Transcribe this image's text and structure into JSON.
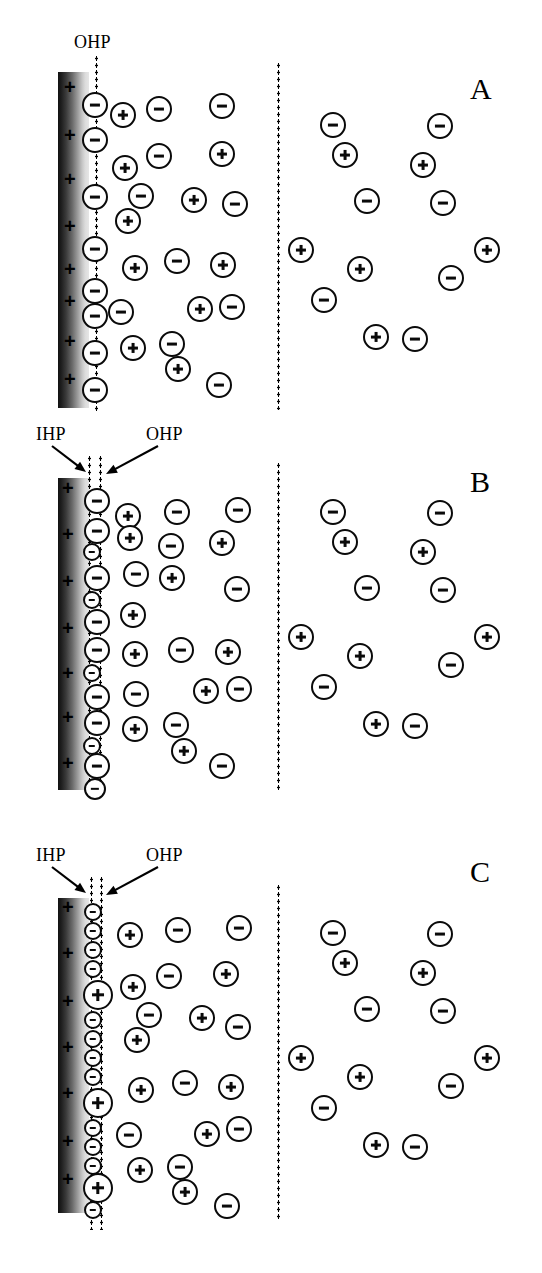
{
  "figure": {
    "width": 542,
    "height": 1273,
    "colors": {
      "ink": "#0a0a0a",
      "background": "#ffffff",
      "electrode_dark": "#111111",
      "electrode_light": "#e6e6e6"
    }
  },
  "panels": [
    {
      "id": "A",
      "label": "A",
      "label_x": 470,
      "label_y": 72,
      "top": 60,
      "electrode": {
        "x": 58,
        "y": 72,
        "w": 31,
        "h": 336
      },
      "planes": [
        {
          "name": "OHP",
          "x": 95,
          "y": 55,
          "h": 358
        }
      ],
      "bulk_boundary": {
        "x": 277,
        "y": 62,
        "h": 348
      },
      "annotations": [
        {
          "text": "OHP",
          "x": 74,
          "y": 32,
          "arrow": false
        }
      ],
      "surface_charges": [
        {
          "x": 64,
          "y": 86
        },
        {
          "x": 64,
          "y": 134
        },
        {
          "x": 64,
          "y": 178
        },
        {
          "x": 64,
          "y": 225
        },
        {
          "x": 64,
          "y": 268
        },
        {
          "x": 64,
          "y": 300
        },
        {
          "x": 64,
          "y": 340
        },
        {
          "x": 64,
          "y": 378
        }
      ],
      "compact_ions": [
        {
          "sign": "neg",
          "x": 95,
          "y": 105,
          "r": 13
        },
        {
          "sign": "neg",
          "x": 95,
          "y": 140,
          "r": 13
        },
        {
          "sign": "neg",
          "x": 95,
          "y": 197,
          "r": 13
        },
        {
          "sign": "neg",
          "x": 95,
          "y": 249,
          "r": 13
        },
        {
          "sign": "neg",
          "x": 95,
          "y": 291,
          "r": 13
        },
        {
          "sign": "neg",
          "x": 95,
          "y": 316,
          "r": 13
        },
        {
          "sign": "neg",
          "x": 95,
          "y": 353,
          "r": 13
        },
        {
          "sign": "neg",
          "x": 95,
          "y": 390,
          "r": 13
        }
      ],
      "diffuse_ions": [
        {
          "sign": "pos",
          "x": 123,
          "y": 115,
          "r": 13
        },
        {
          "sign": "neg",
          "x": 159,
          "y": 109,
          "r": 13
        },
        {
          "sign": "neg",
          "x": 222,
          "y": 106,
          "r": 13
        },
        {
          "sign": "neg",
          "x": 159,
          "y": 156,
          "r": 13
        },
        {
          "sign": "pos",
          "x": 222,
          "y": 154,
          "r": 13
        },
        {
          "sign": "pos",
          "x": 125,
          "y": 168,
          "r": 13
        },
        {
          "sign": "neg",
          "x": 141,
          "y": 196,
          "r": 13
        },
        {
          "sign": "pos",
          "x": 194,
          "y": 200,
          "r": 13
        },
        {
          "sign": "neg",
          "x": 235,
          "y": 204,
          "r": 13
        },
        {
          "sign": "pos",
          "x": 128,
          "y": 221,
          "r": 13
        },
        {
          "sign": "pos",
          "x": 135,
          "y": 268,
          "r": 13
        },
        {
          "sign": "neg",
          "x": 177,
          "y": 261,
          "r": 13
        },
        {
          "sign": "pos",
          "x": 223,
          "y": 265,
          "r": 13
        },
        {
          "sign": "neg",
          "x": 121,
          "y": 312,
          "r": 13
        },
        {
          "sign": "pos",
          "x": 200,
          "y": 309,
          "r": 13
        },
        {
          "sign": "neg",
          "x": 232,
          "y": 307,
          "r": 13
        },
        {
          "sign": "pos",
          "x": 133,
          "y": 348,
          "r": 13
        },
        {
          "sign": "neg",
          "x": 172,
          "y": 344,
          "r": 13
        },
        {
          "sign": "pos",
          "x": 178,
          "y": 369,
          "r": 13
        },
        {
          "sign": "neg",
          "x": 219,
          "y": 385,
          "r": 13
        }
      ],
      "bulk_ions": [
        {
          "sign": "neg",
          "x": 333,
          "y": 125,
          "r": 13
        },
        {
          "sign": "neg",
          "x": 440,
          "y": 126,
          "r": 13
        },
        {
          "sign": "pos",
          "x": 345,
          "y": 155,
          "r": 13
        },
        {
          "sign": "pos",
          "x": 423,
          "y": 165,
          "r": 13
        },
        {
          "sign": "neg",
          "x": 367,
          "y": 201,
          "r": 13
        },
        {
          "sign": "neg",
          "x": 443,
          "y": 203,
          "r": 13
        },
        {
          "sign": "pos",
          "x": 301,
          "y": 250,
          "r": 13
        },
        {
          "sign": "pos",
          "x": 487,
          "y": 250,
          "r": 13
        },
        {
          "sign": "pos",
          "x": 360,
          "y": 269,
          "r": 13
        },
        {
          "sign": "neg",
          "x": 451,
          "y": 278,
          "r": 13
        },
        {
          "sign": "neg",
          "x": 324,
          "y": 300,
          "r": 13
        },
        {
          "sign": "pos",
          "x": 376,
          "y": 337,
          "r": 13
        },
        {
          "sign": "neg",
          "x": 415,
          "y": 339,
          "r": 13
        }
      ]
    },
    {
      "id": "B",
      "label": "B",
      "label_x": 470,
      "label_y": 465,
      "top": 430,
      "electrode": {
        "x": 58,
        "y": 478,
        "w": 31,
        "h": 312
      },
      "planes": [
        {
          "name": "IHP",
          "x": 88,
          "y": 455,
          "h": 335
        },
        {
          "name": "OHP",
          "x": 99,
          "y": 455,
          "h": 340
        }
      ],
      "bulk_boundary": {
        "x": 277,
        "y": 462,
        "h": 330
      },
      "annotations": [
        {
          "text": "IHP",
          "x": 36,
          "y": 424,
          "arrow": true,
          "ax1": 52,
          "ay1": 446,
          "ax2": 86,
          "ay2": 472
        },
        {
          "text": "OHP",
          "x": 146,
          "y": 424,
          "arrow": true,
          "ax1": 158,
          "ay1": 446,
          "ax2": 106,
          "ay2": 474
        }
      ],
      "surface_charges": [
        {
          "x": 62,
          "y": 487
        },
        {
          "x": 62,
          "y": 533
        },
        {
          "x": 62,
          "y": 580
        },
        {
          "x": 62,
          "y": 627
        },
        {
          "x": 62,
          "y": 672
        },
        {
          "x": 62,
          "y": 716
        },
        {
          "x": 62,
          "y": 762
        }
      ],
      "compact_ions": [
        {
          "sign": "neg",
          "x": 97,
          "y": 501,
          "r": 13
        },
        {
          "sign": "neg",
          "x": 97,
          "y": 531,
          "r": 13
        },
        {
          "sign": "neg",
          "x": 92,
          "y": 552,
          "r": 9
        },
        {
          "sign": "neg",
          "x": 97,
          "y": 578,
          "r": 13
        },
        {
          "sign": "neg",
          "x": 92,
          "y": 600,
          "r": 9
        },
        {
          "sign": "neg",
          "x": 97,
          "y": 622,
          "r": 13
        },
        {
          "sign": "neg",
          "x": 97,
          "y": 650,
          "r": 13
        },
        {
          "sign": "neg",
          "x": 92,
          "y": 673,
          "r": 9
        },
        {
          "sign": "neg",
          "x": 97,
          "y": 697,
          "r": 13
        },
        {
          "sign": "neg",
          "x": 97,
          "y": 723,
          "r": 13
        },
        {
          "sign": "neg",
          "x": 92,
          "y": 746,
          "r": 9
        },
        {
          "sign": "neg",
          "x": 97,
          "y": 766,
          "r": 13
        },
        {
          "sign": "neg",
          "x": 95,
          "y": 789,
          "r": 11
        }
      ],
      "diffuse_ions": [
        {
          "sign": "pos",
          "x": 128,
          "y": 516,
          "r": 13
        },
        {
          "sign": "neg",
          "x": 177,
          "y": 512,
          "r": 13
        },
        {
          "sign": "neg",
          "x": 238,
          "y": 510,
          "r": 13
        },
        {
          "sign": "pos",
          "x": 130,
          "y": 538,
          "r": 13
        },
        {
          "sign": "neg",
          "x": 171,
          "y": 546,
          "r": 13
        },
        {
          "sign": "pos",
          "x": 222,
          "y": 543,
          "r": 13
        },
        {
          "sign": "neg",
          "x": 136,
          "y": 574,
          "r": 13
        },
        {
          "sign": "pos",
          "x": 172,
          "y": 578,
          "r": 13
        },
        {
          "sign": "neg",
          "x": 237,
          "y": 589,
          "r": 13
        },
        {
          "sign": "pos",
          "x": 133,
          "y": 615,
          "r": 13
        },
        {
          "sign": "pos",
          "x": 135,
          "y": 654,
          "r": 13
        },
        {
          "sign": "neg",
          "x": 181,
          "y": 650,
          "r": 13
        },
        {
          "sign": "pos",
          "x": 228,
          "y": 652,
          "r": 13
        },
        {
          "sign": "neg",
          "x": 136,
          "y": 694,
          "r": 13
        },
        {
          "sign": "pos",
          "x": 206,
          "y": 691,
          "r": 13
        },
        {
          "sign": "neg",
          "x": 239,
          "y": 689,
          "r": 13
        },
        {
          "sign": "pos",
          "x": 135,
          "y": 729,
          "r": 13
        },
        {
          "sign": "neg",
          "x": 176,
          "y": 725,
          "r": 13
        },
        {
          "sign": "pos",
          "x": 184,
          "y": 751,
          "r": 13
        },
        {
          "sign": "neg",
          "x": 222,
          "y": 766,
          "r": 13
        }
      ],
      "bulk_ions": [
        {
          "sign": "neg",
          "x": 333,
          "y": 512,
          "r": 13
        },
        {
          "sign": "neg",
          "x": 440,
          "y": 513,
          "r": 13
        },
        {
          "sign": "pos",
          "x": 345,
          "y": 542,
          "r": 13
        },
        {
          "sign": "pos",
          "x": 423,
          "y": 552,
          "r": 13
        },
        {
          "sign": "neg",
          "x": 367,
          "y": 588,
          "r": 13
        },
        {
          "sign": "neg",
          "x": 443,
          "y": 590,
          "r": 13
        },
        {
          "sign": "pos",
          "x": 301,
          "y": 637,
          "r": 13
        },
        {
          "sign": "pos",
          "x": 487,
          "y": 637,
          "r": 13
        },
        {
          "sign": "pos",
          "x": 360,
          "y": 656,
          "r": 13
        },
        {
          "sign": "neg",
          "x": 451,
          "y": 665,
          "r": 13
        },
        {
          "sign": "neg",
          "x": 324,
          "y": 687,
          "r": 13
        },
        {
          "sign": "pos",
          "x": 376,
          "y": 724,
          "r": 13
        },
        {
          "sign": "neg",
          "x": 415,
          "y": 726,
          "r": 13
        }
      ]
    },
    {
      "id": "C",
      "label": "C",
      "label_x": 470,
      "label_y": 855,
      "top": 845,
      "electrode": {
        "x": 58,
        "y": 898,
        "w": 31,
        "h": 315
      },
      "planes": [
        {
          "name": "IHP",
          "x": 90,
          "y": 876,
          "h": 354
        },
        {
          "name": "OHP",
          "x": 100,
          "y": 876,
          "h": 354
        }
      ],
      "bulk_boundary": {
        "x": 277,
        "y": 884,
        "h": 336
      },
      "annotations": [
        {
          "text": "IHP",
          "x": 36,
          "y": 845,
          "arrow": true,
          "ax1": 52,
          "ay1": 867,
          "ax2": 86,
          "ay2": 893
        },
        {
          "text": "OHP",
          "x": 146,
          "y": 845,
          "arrow": true,
          "ax1": 158,
          "ay1": 867,
          "ax2": 106,
          "ay2": 895
        }
      ],
      "surface_charges": [
        {
          "x": 62,
          "y": 906
        },
        {
          "x": 62,
          "y": 952
        },
        {
          "x": 62,
          "y": 1000
        },
        {
          "x": 62,
          "y": 1046
        },
        {
          "x": 62,
          "y": 1092
        },
        {
          "x": 62,
          "y": 1140
        },
        {
          "x": 62,
          "y": 1178
        }
      ],
      "compact_ions": [
        {
          "sign": "neg",
          "x": 93,
          "y": 912,
          "r": 9
        },
        {
          "sign": "neg",
          "x": 93,
          "y": 931,
          "r": 9
        },
        {
          "sign": "neg",
          "x": 93,
          "y": 950,
          "r": 9
        },
        {
          "sign": "neg",
          "x": 93,
          "y": 969,
          "r": 9
        },
        {
          "sign": "pos",
          "x": 98,
          "y": 995,
          "r": 15
        },
        {
          "sign": "neg",
          "x": 93,
          "y": 1020,
          "r": 9
        },
        {
          "sign": "neg",
          "x": 93,
          "y": 1039,
          "r": 9
        },
        {
          "sign": "neg",
          "x": 93,
          "y": 1058,
          "r": 9
        },
        {
          "sign": "neg",
          "x": 93,
          "y": 1077,
          "r": 9
        },
        {
          "sign": "pos",
          "x": 98,
          "y": 1103,
          "r": 15
        },
        {
          "sign": "neg",
          "x": 93,
          "y": 1128,
          "r": 9
        },
        {
          "sign": "neg",
          "x": 93,
          "y": 1147,
          "r": 9
        },
        {
          "sign": "neg",
          "x": 93,
          "y": 1166,
          "r": 9
        },
        {
          "sign": "pos",
          "x": 98,
          "y": 1188,
          "r": 15
        },
        {
          "sign": "neg",
          "x": 93,
          "y": 1210,
          "r": 9
        }
      ],
      "diffuse_ions": [
        {
          "sign": "pos",
          "x": 130,
          "y": 935,
          "r": 13
        },
        {
          "sign": "neg",
          "x": 178,
          "y": 930,
          "r": 13
        },
        {
          "sign": "neg",
          "x": 239,
          "y": 928,
          "r": 13
        },
        {
          "sign": "neg",
          "x": 169,
          "y": 976,
          "r": 13
        },
        {
          "sign": "pos",
          "x": 226,
          "y": 974,
          "r": 13
        },
        {
          "sign": "pos",
          "x": 133,
          "y": 987,
          "r": 13
        },
        {
          "sign": "neg",
          "x": 149,
          "y": 1015,
          "r": 13
        },
        {
          "sign": "pos",
          "x": 202,
          "y": 1018,
          "r": 13
        },
        {
          "sign": "neg",
          "x": 238,
          "y": 1027,
          "r": 13
        },
        {
          "sign": "pos",
          "x": 137,
          "y": 1040,
          "r": 13
        },
        {
          "sign": "pos",
          "x": 141,
          "y": 1090,
          "r": 13
        },
        {
          "sign": "neg",
          "x": 185,
          "y": 1083,
          "r": 13
        },
        {
          "sign": "pos",
          "x": 231,
          "y": 1087,
          "r": 13
        },
        {
          "sign": "neg",
          "x": 129,
          "y": 1135,
          "r": 13
        },
        {
          "sign": "pos",
          "x": 207,
          "y": 1134,
          "r": 13
        },
        {
          "sign": "neg",
          "x": 239,
          "y": 1129,
          "r": 13
        },
        {
          "sign": "pos",
          "x": 140,
          "y": 1170,
          "r": 13
        },
        {
          "sign": "neg",
          "x": 180,
          "y": 1167,
          "r": 13
        },
        {
          "sign": "pos",
          "x": 185,
          "y": 1192,
          "r": 13
        },
        {
          "sign": "neg",
          "x": 227,
          "y": 1206,
          "r": 13
        }
      ],
      "bulk_ions": [
        {
          "sign": "neg",
          "x": 333,
          "y": 933,
          "r": 13
        },
        {
          "sign": "neg",
          "x": 440,
          "y": 934,
          "r": 13
        },
        {
          "sign": "pos",
          "x": 345,
          "y": 963,
          "r": 13
        },
        {
          "sign": "pos",
          "x": 423,
          "y": 973,
          "r": 13
        },
        {
          "sign": "neg",
          "x": 367,
          "y": 1009,
          "r": 13
        },
        {
          "sign": "neg",
          "x": 443,
          "y": 1011,
          "r": 13
        },
        {
          "sign": "pos",
          "x": 301,
          "y": 1058,
          "r": 13
        },
        {
          "sign": "pos",
          "x": 487,
          "y": 1058,
          "r": 13
        },
        {
          "sign": "pos",
          "x": 360,
          "y": 1077,
          "r": 13
        },
        {
          "sign": "neg",
          "x": 451,
          "y": 1086,
          "r": 13
        },
        {
          "sign": "neg",
          "x": 324,
          "y": 1108,
          "r": 13
        },
        {
          "sign": "pos",
          "x": 376,
          "y": 1145,
          "r": 13
        },
        {
          "sign": "neg",
          "x": 415,
          "y": 1147,
          "r": 13
        }
      ]
    }
  ]
}
